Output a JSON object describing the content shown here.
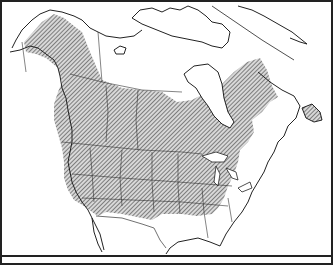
{
  "map": {
    "type": "range-map",
    "region": "North America",
    "shading": "diagonal-hatch",
    "colors": {
      "outline": "#222222",
      "hatch": "#555555",
      "background": "#ffffff"
    }
  },
  "caption": {
    "text": ""
  }
}
